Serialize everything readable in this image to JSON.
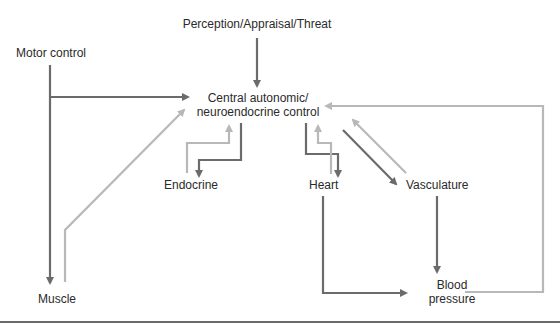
{
  "diagram": {
    "nodes": {
      "perception": "Perception/Appraisal/Threat",
      "motor_control": "Motor control",
      "central_line1": "Central autonomic/",
      "central_line2": "neuroendocrine control",
      "endocrine": "Endocrine",
      "heart": "Heart",
      "vasculature": "Vasculature",
      "muscle": "Muscle",
      "blood_pressure_line1": "Blood",
      "blood_pressure_line2": "pressure"
    },
    "colors": {
      "efferent": "#6b6b6b",
      "afferent": "#b8b8b8",
      "text": "#2a2a2a",
      "rule": "#6a6a6a"
    },
    "edges": [
      {
        "from": "Perception/Appraisal/Threat",
        "to": "Central autonomic/neuroendocrine control",
        "type": "efferent"
      },
      {
        "from": "Motor control",
        "to": "Central autonomic/neuroendocrine control",
        "type": "efferent"
      },
      {
        "from": "Motor control",
        "to": "Muscle",
        "type": "efferent"
      },
      {
        "from": "Muscle",
        "to": "Central autonomic/neuroendocrine control",
        "type": "afferent"
      },
      {
        "from": "Central autonomic/neuroendocrine control",
        "to": "Endocrine",
        "type": "efferent"
      },
      {
        "from": "Endocrine",
        "to": "Central autonomic/neuroendocrine control",
        "type": "afferent"
      },
      {
        "from": "Central autonomic/neuroendocrine control",
        "to": "Heart",
        "type": "efferent"
      },
      {
        "from": "Heart",
        "to": "Central autonomic/neuroendocrine control",
        "type": "afferent"
      },
      {
        "from": "Central autonomic/neuroendocrine control",
        "to": "Vasculature",
        "type": "efferent"
      },
      {
        "from": "Vasculature",
        "to": "Central autonomic/neuroendocrine control",
        "type": "afferent"
      },
      {
        "from": "Vasculature",
        "to": "Blood pressure",
        "type": "efferent"
      },
      {
        "from": "Heart",
        "to": "Blood pressure",
        "type": "efferent"
      },
      {
        "from": "Blood pressure",
        "to": "Central autonomic/neuroendocrine control",
        "type": "afferent"
      }
    ]
  }
}
